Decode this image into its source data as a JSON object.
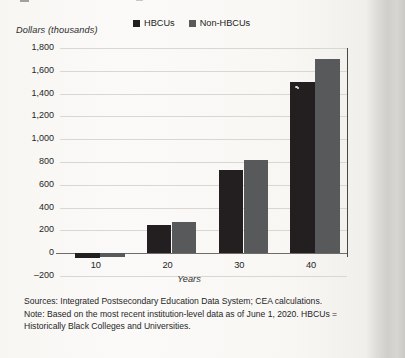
{
  "axes": {
    "y_title": "Dollars (thousands)",
    "x_title": "Years",
    "y_ticks": [
      "1,800",
      "1,600",
      "1,400",
      "1,200",
      "1,000",
      "800",
      "600",
      "400",
      "200",
      "0",
      "–200"
    ],
    "x_ticks": [
      "10",
      "20",
      "30",
      "40"
    ]
  },
  "legend": {
    "items": [
      {
        "label": "HBCUs",
        "color": "#231f20"
      },
      {
        "label": "Non-HBCUs",
        "color": "#58595b"
      }
    ]
  },
  "notes": {
    "line1": "Sources: Integrated Postsecondary Education Data System; CEA calculations.",
    "line2": "Note: Based on the most recent institution-level data as of June 1, 2020. HBCUs =",
    "line3": "Historically Black Colleges and Universities."
  },
  "colors": {
    "hbcu": "#231f20",
    "non_hbcu": "#58595b",
    "grid": "#d9d7d2",
    "axis": "#6f6d69",
    "page": "#f8f7f4"
  },
  "chart_data": {
    "type": "bar",
    "title": "",
    "subtitle": "",
    "xlabel": "Years",
    "ylabel": "Dollars (thousands)",
    "categories": [
      "10",
      "20",
      "30",
      "40"
    ],
    "series": [
      {
        "name": "HBCUs",
        "color": "#231f20",
        "values": [
          -40,
          250,
          730,
          1500
        ]
      },
      {
        "name": "Non-HBCUs",
        "color": "#58595b",
        "values": [
          -30,
          270,
          820,
          1700
        ]
      }
    ],
    "ylim": [
      -200,
      1800
    ],
    "ytick_step": 200,
    "grid": true,
    "legend_position": "top-center",
    "annotations": []
  }
}
